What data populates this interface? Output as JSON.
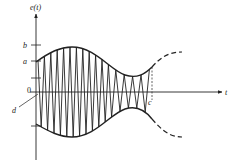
{
  "figure": {
    "y_axis_label": "e(t)",
    "x_axis_label": "t",
    "origin_label": "0",
    "tick_labels": {
      "b": "b",
      "a": "a"
    },
    "pointer_label": "d",
    "marker_label": "c",
    "colors": {
      "ink": "#222222",
      "background": "#ffffff"
    }
  }
}
